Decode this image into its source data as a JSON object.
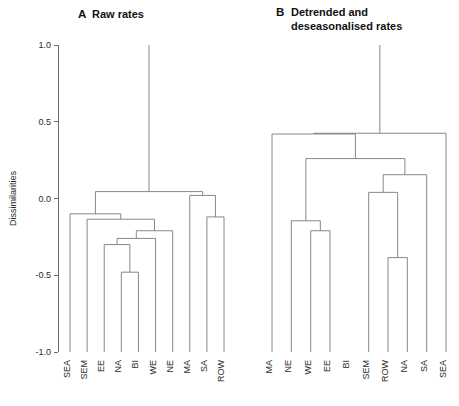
{
  "figure": {
    "width": 459,
    "height": 406,
    "background": "#ffffff",
    "line_color": "#7a7a7a",
    "axis_color": "#6e6e6e",
    "text_color": "#2b2b2b"
  },
  "axis": {
    "title": "Dissimilarities",
    "ticks": [
      "1.0",
      "0.5",
      "0.0",
      "-0.5",
      "-1.0"
    ],
    "tick_values": [
      1.0,
      0.5,
      0.0,
      -0.5,
      -1.0
    ],
    "ylim": [
      -1.0,
      1.0
    ]
  },
  "panels": [
    {
      "letter": "A",
      "title_lines": [
        "Raw rates"
      ]
    },
    {
      "letter": "B",
      "title_lines": [
        "Detrended and",
        "deseasonalised rates"
      ]
    }
  ],
  "chart_data": [
    {
      "type": "dendrogram",
      "panel": "A",
      "title": "Raw rates",
      "ylabel": "Dissimilarities",
      "ylim": [
        -1.0,
        1.0
      ],
      "yticks": [
        -1.0,
        -0.5,
        0.0,
        0.5,
        1.0
      ],
      "grid": false,
      "leaf_order": [
        "SEA",
        "SEM",
        "EE",
        "NA",
        "BI",
        "WE",
        "NE",
        "MA",
        "SA",
        "ROW"
      ],
      "leaf_baseline": -1.0,
      "merges": [
        {
          "id": "m1",
          "left": "NA",
          "right": "BI",
          "height": -0.48
        },
        {
          "id": "m2",
          "left": "EE",
          "right": "m1",
          "height": -0.3
        },
        {
          "id": "m3",
          "left": "m2",
          "right": "WE",
          "height": -0.26
        },
        {
          "id": "m4",
          "left": "m3",
          "right": "NE",
          "height": -0.21
        },
        {
          "id": "m5",
          "left": "SEM",
          "right": "m4",
          "height": -0.135
        },
        {
          "id": "m6",
          "left": "SA",
          "right": "ROW",
          "height": -0.12
        },
        {
          "id": "m7",
          "left": "MA",
          "right": "m6",
          "height": 0.02
        },
        {
          "id": "m8",
          "left": "SEA",
          "right": "m5",
          "height": -0.1
        },
        {
          "id": "m9",
          "left": "m8",
          "right": "m7",
          "height": 0.045
        },
        {
          "id": "root",
          "left": "m9",
          "right": null,
          "height": 1.0
        }
      ],
      "root_stem_top": 1.0
    },
    {
      "type": "dendrogram",
      "panel": "B",
      "title": "Detrended and deseasonalised rates",
      "ylabel": "Dissimilarities",
      "ylim": [
        -1.0,
        1.0
      ],
      "yticks": [
        -1.0,
        -0.5,
        0.0,
        0.5,
        1.0
      ],
      "grid": false,
      "leaf_order": [
        "MA",
        "NE",
        "WE",
        "EE",
        "BI",
        "SEM",
        "ROW",
        "NA",
        "SA",
        "SEA"
      ],
      "leaf_baseline": -1.0,
      "merges": [
        {
          "id": "n1",
          "left": "WE",
          "right": "EE",
          "height": -0.21
        },
        {
          "id": "n2",
          "left": "NE",
          "right": "n1",
          "height": -0.145
        },
        {
          "id": "n3",
          "left": "ROW",
          "right": "NA",
          "height": -0.385
        },
        {
          "id": "n4",
          "left": "SEM",
          "right": "n3",
          "height": 0.04
        },
        {
          "id": "n5",
          "left": "n4",
          "right": "SA",
          "height": 0.155
        },
        {
          "id": "n6",
          "left": "n2",
          "right": "n5",
          "height": 0.26
        },
        {
          "id": "n7",
          "left": "MA",
          "right": "n6",
          "height": 0.42
        },
        {
          "id": "n8",
          "left": "n7",
          "right": "SEA",
          "height": 0.425
        },
        {
          "id": "root",
          "left": "n8",
          "right": null,
          "height": 1.0
        }
      ],
      "root_stem_top": 1.0
    }
  ]
}
